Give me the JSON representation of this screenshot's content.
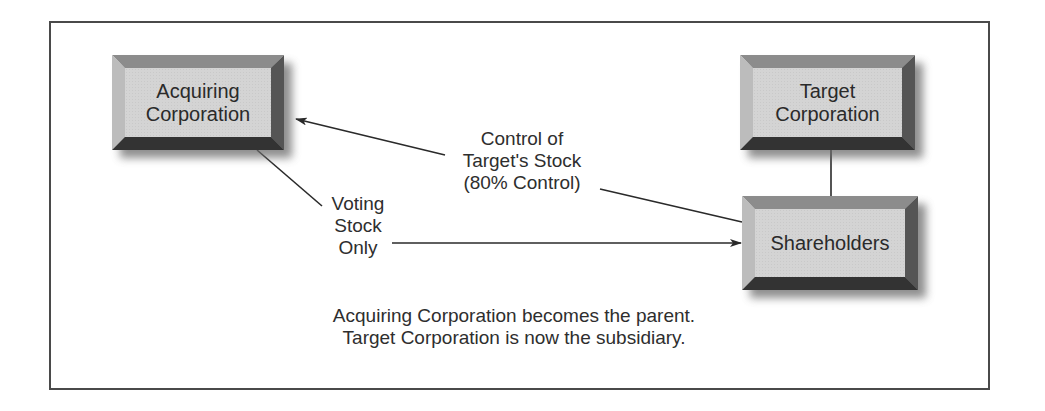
{
  "diagram": {
    "nodes": {
      "acquiring": {
        "line1": "Acquiring",
        "line2": "Corporation"
      },
      "target": {
        "line1": "Target",
        "line2": "Corporation"
      },
      "shareholders": {
        "label": "Shareholders"
      }
    },
    "edges": {
      "control_label": {
        "line1": "Control of",
        "line2": "Target's Stock",
        "line3": "(80% Control)"
      },
      "voting_label": {
        "line1": "Voting",
        "line2": "Stock",
        "line3": "Only"
      }
    },
    "caption": {
      "line1": "Acquiring Corporation becomes the parent.",
      "line2": "Target Corporation is now the subsidiary."
    },
    "colors": {
      "frame": "#4a4a4a",
      "box_face": "#d4d4d4",
      "bevel_top": "#8c8c8c",
      "bevel_left": "#bcbcbc",
      "bevel_right": "#555555",
      "bevel_bottom": "#333333",
      "line": "#2a2a2a"
    }
  }
}
